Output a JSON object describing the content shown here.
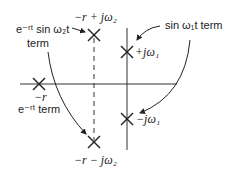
{
  "diagram": {
    "type": "s-plane pole diagram",
    "axes": {
      "real_axis_y": 84,
      "imag_axis_x": 127
    },
    "poles": [
      {
        "id": "neg-r",
        "label": "−r",
        "x": 39,
        "y": 84
      },
      {
        "id": "upper-complex",
        "label": "−r + jω₂",
        "x": 94,
        "y": 35
      },
      {
        "id": "lower-complex",
        "label": "−r − jω₂",
        "x": 94,
        "y": 142
      },
      {
        "id": "plus-jw1",
        "label": "+jω₁",
        "x": 127,
        "y": 52
      },
      {
        "id": "minus-jw1",
        "label": "−jω₁",
        "x": 127,
        "y": 119
      }
    ],
    "annotations": {
      "damped_sine_line1": "e⁻ʳᵗ sin ω₂t",
      "damped_sine_line2": "term",
      "exp_term": "e⁻ʳᵗ term",
      "sine_term": "sin ω₁t term"
    },
    "colors": {
      "ink": "#222222",
      "background": "#ffffff"
    }
  }
}
